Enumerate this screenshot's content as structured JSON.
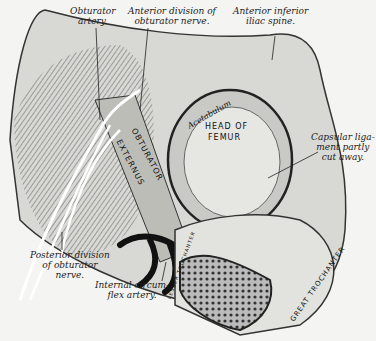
{
  "figure": {
    "labels": {
      "obturator_artery": "Obturator\nartery.",
      "anterior_division": "Anterior division of\nobturator nerve.",
      "anterior_inferior_iliac_spine": "Anterior inferior\niliac spine.",
      "capsular_ligament": "Capsular liga-\nment partly\ncut away.",
      "posterior_division": "Posterior division\nof obturator\nnerve.",
      "internal_circumflex": "Internal circum-\nflex artery."
    },
    "structure_labels": {
      "acetabulum": "Acetabulum",
      "head_of_femur_1": "HEAD OF",
      "head_of_femur_2": "FEMUR",
      "obturator": "OBTURATOR",
      "externus": "EXTERNUS",
      "lesser_trochanter": "LESSER TROCHANTER",
      "great_trochanter": "GREAT TROCHANTER"
    }
  }
}
